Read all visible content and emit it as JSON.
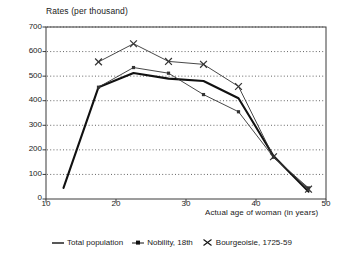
{
  "chart_data": {
    "type": "line",
    "title": "",
    "ylabel": "Rates (per thousand)",
    "xlabel": "Actual age of woman (in years)",
    "xlim": [
      10,
      50
    ],
    "ylim": [
      0,
      700
    ],
    "xticks": [
      10,
      20,
      30,
      40,
      50
    ],
    "yticks": [
      0,
      100,
      200,
      300,
      400,
      500,
      600,
      700
    ],
    "grid": "horizontal-dotted",
    "legend_position": "bottom-center",
    "x": [
      12.5,
      17.5,
      22.5,
      27.5,
      32.5,
      37.5,
      42.5,
      47.5
    ],
    "series": [
      {
        "name": "Total population",
        "marker": "none",
        "style": "thick-solid",
        "color": "#111111",
        "x": [
          12.5,
          17.5,
          22.5,
          27.5,
          32.5,
          37.5,
          42.5,
          47.5
        ],
        "values": [
          45,
          455,
          513,
          490,
          480,
          410,
          175,
          30
        ]
      },
      {
        "name": "Nobility, 18th",
        "marker": "square-dot",
        "style": "thin-solid",
        "color": "#333333",
        "x": [
          17.5,
          22.5,
          27.5,
          32.5,
          37.5,
          42.5,
          47.5
        ],
        "values": [
          455,
          535,
          512,
          425,
          355,
          170,
          45
        ]
      },
      {
        "name": "Bourgeoisie, 1725-59",
        "marker": "x-cross",
        "style": "thin-solid",
        "color": "#333333",
        "x": [
          17.5,
          22.5,
          27.5,
          32.5,
          37.5,
          42.5,
          47.5
        ],
        "values": [
          558,
          632,
          560,
          548,
          458,
          172,
          40
        ]
      }
    ]
  },
  "axis": {
    "y_title": "Rates (per thousand)",
    "x_title": "Actual age of woman (in years)",
    "y_tick_labels": [
      "700",
      "600",
      "500",
      "400",
      "300",
      "200",
      "100",
      "0"
    ],
    "x_tick_labels": [
      "10",
      "20",
      "30",
      "40",
      "50"
    ]
  },
  "legend": {
    "items": [
      {
        "label": "Total population",
        "marker": "line"
      },
      {
        "label": "Nobility, 18th",
        "marker": "square-dot"
      },
      {
        "label": "Bourgeoisie, 1725-59",
        "marker": "x-cross"
      }
    ]
  }
}
